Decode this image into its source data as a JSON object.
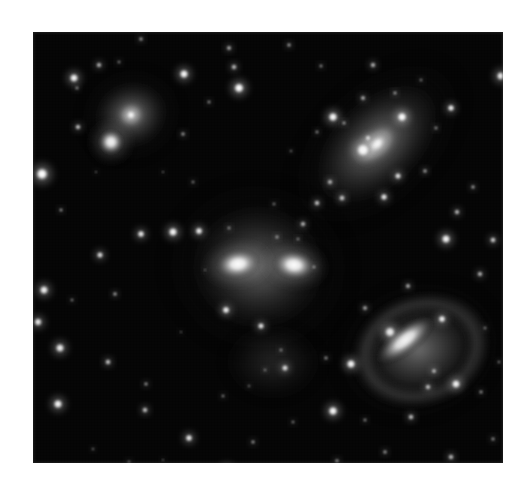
{
  "page": {
    "background_color": "#ffffff",
    "image_kind": "astronomical-photograph",
    "color_mode": "grayscale",
    "frame": {
      "x": 33,
      "y": 32,
      "width": 470,
      "height": 431,
      "background_color": "#030303",
      "border_color": "#c8c8c8"
    }
  },
  "scene": {
    "description": "Compact group of four interacting galaxies on a dense star field",
    "sky_color": "#030303",
    "star_color": "#ffffff",
    "galaxy_glow_color": "#f2f2f2"
  },
  "galaxies": [
    {
      "id": "galaxy-top-left-elliptical",
      "label": "elliptical galaxy with compact companion",
      "cx": 98,
      "cy": 83,
      "rx": 46,
      "ry": 41,
      "rotation": -20,
      "core_brightness": 1.0,
      "halo_brightness": 0.42,
      "companion": {
        "cx": 78,
        "cy": 110,
        "r": 14,
        "brightness": 0.95
      }
    },
    {
      "id": "galaxy-top-right-spiral",
      "label": "inclined spiral galaxy with bright nucleus and knots",
      "cx": 344,
      "cy": 112,
      "rx": 95,
      "ry": 56,
      "rotation": -44,
      "core_brightness": 0.92,
      "halo_brightness": 0.4
    },
    {
      "id": "galaxy-center-merging-pair",
      "label": "merging double-nucleus galaxy pair in common envelope",
      "cx": 225,
      "cy": 235,
      "rx": 86,
      "ry": 80,
      "rotation": 8,
      "core_brightness": 1.0,
      "halo_brightness": 0.3,
      "nuclei": [
        {
          "cx": 205,
          "cy": 232,
          "rx": 24,
          "ry": 16,
          "rotation": -8
        },
        {
          "cx": 261,
          "cy": 233,
          "rx": 23,
          "ry": 16,
          "rotation": 8
        }
      ],
      "tidal_plume": {
        "cx": 240,
        "cy": 330,
        "rx": 52,
        "ry": 40,
        "brightness": 0.16
      }
    },
    {
      "id": "galaxy-lower-right-barred-spiral",
      "label": "barred spiral galaxy with outer ring",
      "cx": 386,
      "cy": 318,
      "rx": 78,
      "ry": 63,
      "rotation": -18,
      "core_brightness": 0.88,
      "halo_brightness": 0.3,
      "bar": {
        "cx": 372,
        "cy": 308,
        "rx": 38,
        "ry": 15,
        "rotation": -38
      },
      "ring": {
        "cx": 388,
        "cy": 318,
        "rx": 70,
        "ry": 56,
        "rotation": -18
      }
    }
  ],
  "stars": [
    {
      "cx": 9,
      "cy": 142,
      "r": 7.5,
      "b": 1.0
    },
    {
      "cx": 11,
      "cy": 258,
      "r": 5.5,
      "b": 0.92
    },
    {
      "cx": 5,
      "cy": 290,
      "r": 5.0,
      "b": 0.88
    },
    {
      "cx": 27,
      "cy": 316,
      "r": 5.5,
      "b": 0.9
    },
    {
      "cx": 45,
      "cy": 95,
      "r": 3.2,
      "b": 0.8
    },
    {
      "cx": 28,
      "cy": 178,
      "r": 2.2,
      "b": 0.6
    },
    {
      "cx": 44,
      "cy": 56,
      "r": 2.2,
      "b": 0.55
    },
    {
      "cx": 67,
      "cy": 223,
      "r": 4.0,
      "b": 0.82
    },
    {
      "cx": 82,
      "cy": 262,
      "r": 2.6,
      "b": 0.62
    },
    {
      "cx": 39,
      "cy": 268,
      "r": 2.0,
      "b": 0.5
    },
    {
      "cx": 75,
      "cy": 330,
      "r": 3.4,
      "b": 0.78
    },
    {
      "cx": 25,
      "cy": 372,
      "r": 5.6,
      "b": 0.95
    },
    {
      "cx": 113,
      "cy": 352,
      "r": 2.4,
      "b": 0.58
    },
    {
      "cx": 140,
      "cy": 200,
      "r": 5.6,
      "b": 0.95
    },
    {
      "cx": 166,
      "cy": 199,
      "r": 4.6,
      "b": 0.9
    },
    {
      "cx": 108,
      "cy": 202,
      "r": 4.4,
      "b": 0.88
    },
    {
      "cx": 160,
      "cy": 150,
      "r": 2.0,
      "b": 0.5
    },
    {
      "cx": 150,
      "cy": 102,
      "r": 2.6,
      "b": 0.58
    },
    {
      "cx": 108,
      "cy": 7,
      "r": 2.6,
      "b": 0.6
    },
    {
      "cx": 86,
      "cy": 30,
      "r": 2.0,
      "b": 0.5
    },
    {
      "cx": 66,
      "cy": 33,
      "r": 3.2,
      "b": 0.72
    },
    {
      "cx": 112,
      "cy": 378,
      "r": 3.4,
      "b": 0.76
    },
    {
      "cx": 156,
      "cy": 406,
      "r": 4.4,
      "b": 0.88
    },
    {
      "cx": 190,
      "cy": 364,
      "r": 2.0,
      "b": 0.52
    },
    {
      "cx": 41,
      "cy": 46,
      "r": 5.4,
      "b": 0.94
    },
    {
      "cx": 151,
      "cy": 42,
      "r": 5.6,
      "b": 0.96
    },
    {
      "cx": 176,
      "cy": 70,
      "r": 2.2,
      "b": 0.55
    },
    {
      "cx": 196,
      "cy": 16,
      "r": 3.0,
      "b": 0.68
    },
    {
      "cx": 206,
      "cy": 56,
      "r": 6.2,
      "b": 1.0
    },
    {
      "cx": 201,
      "cy": 35,
      "r": 3.4,
      "b": 0.72
    },
    {
      "cx": 256,
      "cy": 13,
      "r": 2.6,
      "b": 0.6
    },
    {
      "cx": 288,
      "cy": 34,
      "r": 2.2,
      "b": 0.54
    },
    {
      "cx": 220,
      "cy": 410,
      "r": 2.4,
      "b": 0.58
    },
    {
      "cx": 194,
      "cy": 440,
      "r": 6.0,
      "b": 0.98
    },
    {
      "cx": 260,
      "cy": 390,
      "r": 2.0,
      "b": 0.5
    },
    {
      "cx": 241,
      "cy": 172,
      "r": 2.0,
      "b": 0.48
    },
    {
      "cx": 193,
      "cy": 278,
      "r": 4.6,
      "b": 0.9
    },
    {
      "cx": 228,
      "cy": 294,
      "r": 4.0,
      "b": 0.85
    },
    {
      "cx": 270,
      "cy": 192,
      "r": 3.2,
      "b": 0.72
    },
    {
      "cx": 284,
      "cy": 171,
      "r": 3.4,
      "b": 0.76
    },
    {
      "cx": 252,
      "cy": 336,
      "r": 4.0,
      "b": 0.82
    },
    {
      "cx": 293,
      "cy": 326,
      "r": 2.4,
      "b": 0.55
    },
    {
      "cx": 318,
      "cy": 332,
      "r": 5.6,
      "b": 0.95
    },
    {
      "cx": 281,
      "cy": 235,
      "r": 2.2,
      "b": 0.55
    },
    {
      "cx": 300,
      "cy": 85,
      "r": 5.8,
      "b": 0.96
    },
    {
      "cx": 284,
      "cy": 100,
      "r": 2.2,
      "b": 0.52
    },
    {
      "cx": 340,
      "cy": 33,
      "r": 3.2,
      "b": 0.72
    },
    {
      "cx": 330,
      "cy": 66,
      "r": 3.0,
      "b": 0.68
    },
    {
      "cx": 335,
      "cy": 106,
      "r": 3.4,
      "b": 0.76
    },
    {
      "cx": 418,
      "cy": 76,
      "r": 4.2,
      "b": 0.9
    },
    {
      "cx": 468,
      "cy": 44,
      "r": 5.4,
      "b": 0.95
    },
    {
      "cx": 365,
      "cy": 144,
      "r": 4.0,
      "b": 0.84
    },
    {
      "cx": 351,
      "cy": 165,
      "r": 4.2,
      "b": 0.86
    },
    {
      "cx": 424,
      "cy": 180,
      "r": 3.2,
      "b": 0.74
    },
    {
      "cx": 440,
      "cy": 155,
      "r": 2.6,
      "b": 0.6
    },
    {
      "cx": 413,
      "cy": 207,
      "r": 5.6,
      "b": 0.94
    },
    {
      "cx": 460,
      "cy": 208,
      "r": 3.6,
      "b": 0.78
    },
    {
      "cx": 447,
      "cy": 242,
      "r": 3.2,
      "b": 0.72
    },
    {
      "cx": 375,
      "cy": 254,
      "r": 3.0,
      "b": 0.68
    },
    {
      "cx": 332,
      "cy": 276,
      "r": 3.0,
      "b": 0.65
    },
    {
      "cx": 409,
      "cy": 287,
      "r": 4.6,
      "b": 0.9
    },
    {
      "cx": 395,
      "cy": 355,
      "r": 3.4,
      "b": 0.72
    },
    {
      "cx": 423,
      "cy": 352,
      "r": 5.4,
      "b": 0.93
    },
    {
      "cx": 448,
      "cy": 360,
      "r": 2.4,
      "b": 0.55
    },
    {
      "cx": 378,
      "cy": 385,
      "r": 3.4,
      "b": 0.74
    },
    {
      "cx": 332,
      "cy": 388,
      "r": 2.2,
      "b": 0.52
    },
    {
      "cx": 352,
      "cy": 420,
      "r": 2.6,
      "b": 0.58
    },
    {
      "cx": 300,
      "cy": 379,
      "r": 5.8,
      "b": 0.96
    },
    {
      "cx": 304,
      "cy": 429,
      "r": 2.6,
      "b": 0.58
    },
    {
      "cx": 418,
      "cy": 425,
      "r": 3.4,
      "b": 0.72
    },
    {
      "cx": 460,
      "cy": 407,
      "r": 2.4,
      "b": 0.55
    },
    {
      "cx": 452,
      "cy": 296,
      "r": 2.0,
      "b": 0.48
    },
    {
      "cx": 466,
      "cy": 330,
      "r": 2.0,
      "b": 0.46
    },
    {
      "cx": 258,
      "cy": 119,
      "r": 1.8,
      "b": 0.42
    },
    {
      "cx": 130,
      "cy": 140,
      "r": 1.6,
      "b": 0.4
    },
    {
      "cx": 63,
      "cy": 140,
      "r": 1.6,
      "b": 0.38
    },
    {
      "cx": 172,
      "cy": 238,
      "r": 1.6,
      "b": 0.38
    },
    {
      "cx": 216,
      "cy": 354,
      "r": 1.8,
      "b": 0.42
    },
    {
      "cx": 96,
      "cy": 430,
      "r": 2.0,
      "b": 0.48
    },
    {
      "cx": 60,
      "cy": 417,
      "r": 1.8,
      "b": 0.42
    },
    {
      "cx": 148,
      "cy": 300,
      "r": 1.6,
      "b": 0.36
    },
    {
      "cx": 388,
      "cy": 48,
      "r": 2.0,
      "b": 0.48
    },
    {
      "cx": 246,
      "cy": 440,
      "r": 1.8,
      "b": 0.42
    },
    {
      "cx": 130,
      "cy": 428,
      "r": 1.6,
      "b": 0.38
    }
  ],
  "galaxy_knots": [
    {
      "cx": 369,
      "cy": 85,
      "r": 6.0,
      "b": 0.98
    },
    {
      "cx": 330,
      "cy": 118,
      "r": 8.5,
      "b": 0.92
    },
    {
      "cx": 297,
      "cy": 150,
      "r": 3.2,
      "b": 0.7
    },
    {
      "cx": 309,
      "cy": 166,
      "r": 3.6,
      "b": 0.74
    },
    {
      "cx": 392,
      "cy": 139,
      "r": 2.6,
      "b": 0.62
    },
    {
      "cx": 362,
      "cy": 61,
      "r": 2.4,
      "b": 0.58
    },
    {
      "cx": 311,
      "cy": 91,
      "r": 2.4,
      "b": 0.58
    },
    {
      "cx": 403,
      "cy": 96,
      "r": 2.2,
      "b": 0.55
    },
    {
      "cx": 244,
      "cy": 205,
      "r": 2.4,
      "b": 0.55
    },
    {
      "cx": 196,
      "cy": 196,
      "r": 2.2,
      "b": 0.52
    },
    {
      "cx": 265,
      "cy": 207,
      "r": 2.0,
      "b": 0.5
    },
    {
      "cx": 357,
      "cy": 300,
      "r": 6.5,
      "b": 0.86
    },
    {
      "cx": 401,
      "cy": 339,
      "r": 3.0,
      "b": 0.68
    },
    {
      "cx": 248,
      "cy": 318,
      "r": 2.2,
      "b": 0.48
    },
    {
      "cx": 232,
      "cy": 338,
      "r": 2.0,
      "b": 0.44
    }
  ]
}
